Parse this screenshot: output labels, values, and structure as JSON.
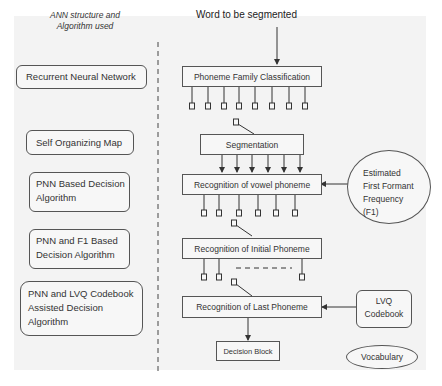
{
  "header_note": {
    "line1": "ANN structure and",
    "line2": "Algorithm used"
  },
  "input_label": "Word to be segmented",
  "algorithms": [
    {
      "lines": [
        "Recurrent Neural Network"
      ]
    },
    {
      "lines": [
        "Self Organizing Map"
      ]
    },
    {
      "lines": [
        "PNN Based Decision",
        "Algorithm"
      ]
    },
    {
      "lines": [
        "PNN and F1 Based",
        "Decision Algorithm"
      ]
    },
    {
      "lines": [
        "PNN and LVQ Codebook",
        "Assisted Decision",
        "Algorithm"
      ]
    }
  ],
  "flow": {
    "phoneme_family": "Phoneme Family Classification",
    "segmentation": "Segmentation",
    "vowel": "Recognition of vowel phoneme",
    "initial": "Recognition of Initial Phoneme",
    "last": "Recognition of Last Phoneme",
    "decision": "Decision Block"
  },
  "side_inputs": {
    "f1": {
      "lines": [
        "Estimated",
        "First Formant",
        "Frequency",
        "(F1)"
      ]
    },
    "lvq": {
      "lines": [
        "LVQ",
        "Codebook"
      ]
    },
    "vocabulary": "Vocabulary"
  },
  "colors": {
    "background": "#f3f3f3",
    "stroke": "#555555",
    "text": "#333333"
  }
}
